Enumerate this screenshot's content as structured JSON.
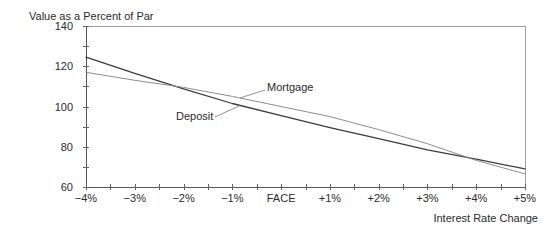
{
  "chart_data": {
    "type": "line",
    "title": "",
    "ylabel": "Value as a Percent of Par",
    "xlabel": "Interest Rate Change",
    "xlim": [
      -4,
      5
    ],
    "ylim": [
      60,
      140
    ],
    "x": [
      -4,
      -3,
      -2,
      -1,
      0,
      1,
      2,
      3,
      4,
      5
    ],
    "x_tick_labels": [
      "−4%",
      "−3%",
      "−2%",
      "−1%",
      "FACE",
      "+1%",
      "+2%",
      "+3%",
      "+4%",
      "+5%"
    ],
    "x_minor_step": 0.5,
    "y_ticks": [
      60,
      80,
      100,
      120,
      140
    ],
    "y_tick_labels": [
      "60",
      "80",
      "100",
      "120",
      "140"
    ],
    "y_minor_step": 10,
    "grid": false,
    "legend": "none (inline labels with leader lines)",
    "series": [
      {
        "name": "Deposit",
        "color": "#3c3c3c",
        "values": [
          124.5,
          116.5,
          108.8,
          101.5,
          95.5,
          89.5,
          84.0,
          78.5,
          73.8,
          69.0
        ]
      },
      {
        "name": "Mortgage",
        "color": "#8e8e8e",
        "values": [
          117.0,
          113.0,
          109.5,
          105.0,
          100.0,
          95.0,
          88.5,
          81.5,
          73.2,
          66.5
        ]
      }
    ],
    "annotations": [
      {
        "text": "Mortgage",
        "series": "Mortgage"
      },
      {
        "text": "Deposit",
        "series": "Deposit"
      }
    ]
  }
}
